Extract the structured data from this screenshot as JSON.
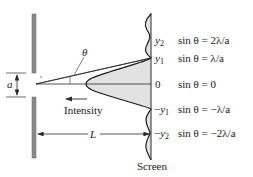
{
  "diagram": {
    "type": "single-slit-diffraction",
    "colors": {
      "barrier": "#8a8a8a",
      "barrier_edge": "#6a6a6a",
      "line": "#2a2a2a",
      "fill": "#e2e2e2",
      "screen_fill": "#ececec"
    },
    "labels": {
      "angle": "θ",
      "slit_width": "a",
      "intensity": "Intensity",
      "distance": "L",
      "screen": "Screen"
    },
    "positions": [
      {
        "label": "y2",
        "symbol": "y",
        "sub": "2",
        "sign": "",
        "condition": "sin θ = 2λ/a"
      },
      {
        "label": "y1",
        "symbol": "y",
        "sub": "1",
        "sign": "",
        "condition": "sin θ = λ/a"
      },
      {
        "label": "0",
        "symbol": "0",
        "sub": "",
        "sign": "",
        "condition": "sin θ = 0"
      },
      {
        "label": "−y1",
        "symbol": "y",
        "sub": "1",
        "sign": "−",
        "condition": "sin θ = −λ/a"
      },
      {
        "label": "−y2",
        "symbol": "y",
        "sub": "2",
        "sign": "−",
        "condition": "sin θ = −2λ/a"
      }
    ]
  }
}
